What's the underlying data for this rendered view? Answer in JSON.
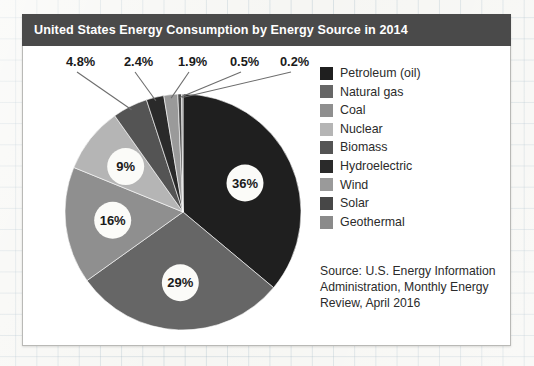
{
  "chart_data": {
    "type": "pie",
    "title": "United States Energy Consumption by Energy Source in  2014",
    "categories": [
      "Petroleum (oil)",
      "Natural gas",
      "Coal",
      "Nuclear",
      "Biomass",
      "Hydroelectric",
      "Wind",
      "Solar",
      "Geothermal"
    ],
    "values": [
      36,
      29,
      16,
      9,
      4.8,
      2.4,
      1.9,
      0.5,
      0.2
    ],
    "value_labels": [
      "36%",
      "29%",
      "16%",
      "9%",
      "4.8%",
      "2.4%",
      "1.9%",
      "0.5%",
      "0.2%"
    ],
    "colors": [
      "#1f1f1f",
      "#666666",
      "#8f8f8f",
      "#b5b5b5",
      "#545454",
      "#2a2a2a",
      "#9a9a9a",
      "#474747",
      "#8a8a8a"
    ],
    "inside_labels": [
      {
        "label": "36%",
        "category": "Petroleum (oil)"
      },
      {
        "label": "29%",
        "category": "Natural gas"
      },
      {
        "label": "16%",
        "category": "Coal"
      },
      {
        "label": "9%",
        "category": "Nuclear"
      }
    ],
    "callout_labels": [
      {
        "label": "4.8%",
        "category": "Biomass"
      },
      {
        "label": "2.4%",
        "category": "Hydroelectric"
      },
      {
        "label": "1.9%",
        "category": "Wind"
      },
      {
        "label": "0.5%",
        "category": "Solar"
      },
      {
        "label": "0.2%",
        "category": "Geothermal"
      }
    ],
    "xlabel": "",
    "ylabel": "",
    "legend_position": "right",
    "grid": false
  },
  "header": {
    "title": "United States Energy Consumption by Energy Source in  2014",
    "bar_color": "#4a4a4a",
    "text_color": "#ffffff"
  },
  "legend": {
    "items": [
      {
        "label": "Petroleum (oil)",
        "color": "#1f1f1f"
      },
      {
        "label": "Natural gas",
        "color": "#666666"
      },
      {
        "label": "Coal",
        "color": "#8f8f8f"
      },
      {
        "label": "Nuclear",
        "color": "#b5b5b5"
      },
      {
        "label": "Biomass",
        "color": "#545454"
      },
      {
        "label": "Hydroelectric",
        "color": "#2a2a2a"
      },
      {
        "label": "Wind",
        "color": "#9a9a9a"
      },
      {
        "label": "Solar",
        "color": "#474747"
      },
      {
        "label": "Geothermal",
        "color": "#8a8a8a"
      }
    ]
  },
  "source": {
    "line1": "Source: U.S. Energy Information",
    "line2": "Administration, Monthly Energy",
    "line3": "Review, April 2016"
  }
}
